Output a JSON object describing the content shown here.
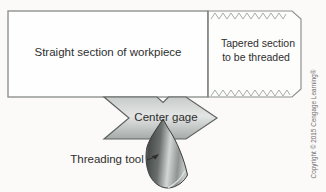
{
  "diagram": {
    "title_context": "Thread cutting setup diagram",
    "workpiece": {
      "straight_label": "Straight section of workpiece",
      "tapered_label_line1": "Tapered section",
      "tapered_label_line2": "to be threaded"
    },
    "center_gage": {
      "label": "Center gage"
    },
    "threading_tool": {
      "label": "Threading tool"
    },
    "copyright": "Copyright © 2015 Cengage Learning®",
    "colors": {
      "background": "#fbfaf8",
      "workpiece_fill": "#fefefe",
      "outline_stroke": "#8e928f",
      "zigzag_stroke": "#9fa3a0",
      "gage_stroke": "#5f6361",
      "tool_stroke": "#383d3b",
      "label_text": "#2e2e2e",
      "copyright_text": "#6e6e6e"
    }
  }
}
